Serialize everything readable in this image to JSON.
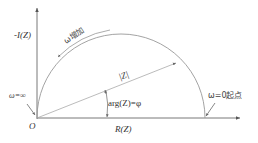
{
  "diagram": {
    "type": "nyquist-semicircle",
    "colors": {
      "axis": "#555555",
      "arc": "#999999",
      "text": "#333333",
      "vector": "#aaaaaa"
    },
    "axes": {
      "y_label": "-I(Z)",
      "x_label": "R(Z)",
      "origin_label": "O"
    },
    "labels": {
      "omega_increase": "ω增加",
      "magnitude": "|Z|",
      "angle": "arg(Z)=φ",
      "omega_infinity": "ω=∞",
      "omega_zero": "ω=0起点"
    }
  }
}
